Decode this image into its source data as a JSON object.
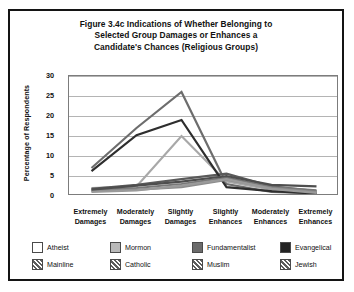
{
  "figure": {
    "title_lines": [
      "Figure 3.4c Indications of Whether Belonging to",
      "Selected Group Damages or Enhances a",
      "Candidate's Chances (Religious Groups)"
    ],
    "border_color": "#141414",
    "background": "#ffffff"
  },
  "chart_data": {
    "type": "line",
    "title": "Figure 3.4c Indications of Whether Belonging to Selected Group Damages or Enhances a Candidate's Chances (Religious Groups)",
    "xlabel": "",
    "ylabel": "Percentage of Respondents",
    "categories": [
      "Extremely Damages",
      "Moderately Damages",
      "Slightly Damages",
      "Slightly Enhances",
      "Moderately Enhances",
      "Extremely Enhances"
    ],
    "category_lines": [
      [
        "Extremely",
        "Damages"
      ],
      [
        "Moderately",
        "Damages"
      ],
      [
        "Slightly",
        "Damages"
      ],
      [
        "Slightly",
        "Enhances"
      ],
      [
        "Moderately",
        "Enhances"
      ],
      [
        "Extremely",
        "Enhances"
      ]
    ],
    "ylim": [
      0,
      30
    ],
    "yticks": [
      0,
      5,
      10,
      15,
      20,
      25,
      30
    ],
    "ytick_labels": [
      "0",
      "5",
      "10",
      "15",
      "20",
      "25",
      "30"
    ],
    "grid": true,
    "grid_axis": "y",
    "legend_position": "bottom",
    "series": [
      {
        "name": "Atheist",
        "swatch": "white",
        "color": "#6d6d6d",
        "values": [
          7.0,
          17.0,
          26.0,
          3.0,
          1.0,
          0.7
        ]
      },
      {
        "name": "Mormon",
        "swatch": "light-gray",
        "color": "#a8a8a8",
        "values": [
          2.0,
          2.4,
          15.0,
          3.6,
          1.6,
          1.0
        ]
      },
      {
        "name": "Fundamentalist",
        "swatch": "mid-gray",
        "color": "#5a5a5a",
        "values": [
          1.8,
          2.8,
          4.2,
          5.6,
          2.4,
          1.2
        ]
      },
      {
        "name": "Evangelical",
        "swatch": "dark",
        "color": "#2e2e2e",
        "values": [
          6.2,
          15.2,
          19.0,
          2.2,
          1.2,
          0.6
        ]
      },
      {
        "name": "Mainline",
        "swatch": "hatch",
        "color": "#787878",
        "values": [
          1.4,
          2.0,
          3.0,
          4.6,
          2.2,
          1.4
        ]
      },
      {
        "name": "Catholic",
        "swatch": "hatch",
        "color": "#8c8c8c",
        "values": [
          1.2,
          1.6,
          2.2,
          4.0,
          2.0,
          1.0
        ]
      },
      {
        "name": "Muslim",
        "swatch": "hatch",
        "color": "#4e4e4e",
        "values": [
          1.6,
          2.6,
          3.6,
          5.0,
          2.8,
          2.4
        ]
      },
      {
        "name": "Jewish",
        "swatch": "hatch",
        "color": "#9a9a9a",
        "values": [
          1.0,
          1.4,
          2.6,
          4.2,
          1.8,
          0.8
        ]
      }
    ]
  },
  "legend": {
    "rows": [
      [
        {
          "label": "Atheist",
          "swatch": "white"
        },
        {
          "label": "Mormon",
          "swatch": "light-gray"
        },
        {
          "label": "Fundamentalist",
          "swatch": "mid-gray"
        },
        {
          "label": "Evangelical",
          "swatch": "dark"
        }
      ],
      [
        {
          "label": "Mainline",
          "swatch": "hatch"
        },
        {
          "label": "Catholic",
          "swatch": "hatch"
        },
        {
          "label": "Muslim",
          "swatch": "hatch"
        },
        {
          "label": "Jewish",
          "swatch": "hatch"
        }
      ]
    ]
  }
}
